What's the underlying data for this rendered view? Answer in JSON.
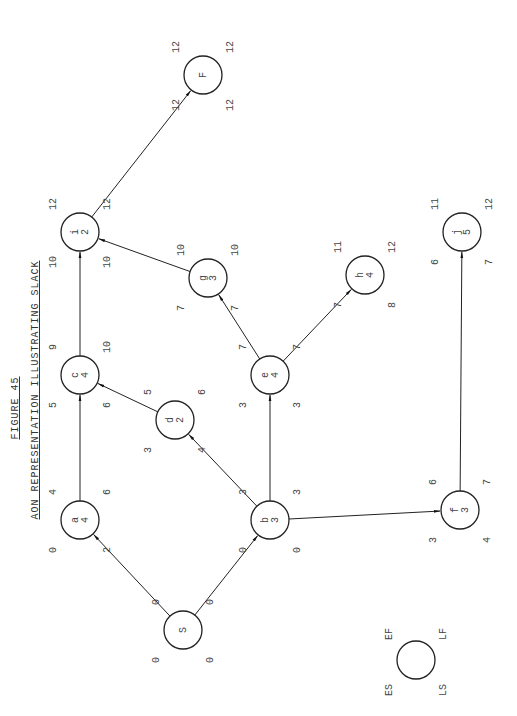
{
  "figure": {
    "number": "FIGURE 45",
    "title": "AON REPRESENTATION ILLUSTRATING SLACK",
    "orientation": "rotated 90 degrees counterclockwise"
  },
  "legend": {
    "es": "ES",
    "ef": "EF",
    "ls": "LS",
    "lf": "LF"
  },
  "nodes": [
    {
      "id": "S",
      "name": "S",
      "dur": "",
      "es": "0",
      "ef": "0",
      "ls": "0",
      "lf": "0",
      "x": 183,
      "y": 630
    },
    {
      "id": "a",
      "name": "a",
      "dur": "4",
      "es": "0",
      "ef": "4",
      "ls": "2",
      "lf": "6",
      "x": 80,
      "y": 520
    },
    {
      "id": "b",
      "name": "b",
      "dur": "3",
      "es": "0",
      "ef": "3",
      "ls": "0",
      "lf": "3",
      "x": 270,
      "y": 520
    },
    {
      "id": "c",
      "name": "c",
      "dur": "4",
      "es": "5",
      "ef": "9",
      "ls": "6",
      "lf": "10",
      "x": 80,
      "y": 375
    },
    {
      "id": "d",
      "name": "d",
      "dur": "2",
      "es": "3",
      "ef": "5",
      "ls": "4",
      "lf": "6",
      "x": 175,
      "y": 420
    },
    {
      "id": "e",
      "name": "e",
      "dur": "4",
      "es": "3",
      "ef": "7",
      "ls": "3",
      "lf": "7",
      "x": 270,
      "y": 375
    },
    {
      "id": "f",
      "name": "f",
      "dur": "3",
      "es": "3",
      "ef": "6",
      "ls": "4",
      "lf": "7",
      "x": 460,
      "y": 510
    },
    {
      "id": "g",
      "name": "g",
      "dur": "3",
      "es": "7",
      "ef": "10",
      "ls": "7",
      "lf": "10",
      "x": 208,
      "y": 278
    },
    {
      "id": "h",
      "name": "h",
      "dur": "4",
      "es": "7",
      "ef": "11",
      "ls": "8",
      "lf": "12",
      "x": 365,
      "y": 275
    },
    {
      "id": "i",
      "name": "i",
      "dur": "2",
      "es": "10",
      "ef": "12",
      "ls": "10",
      "lf": "12",
      "x": 80,
      "y": 232
    },
    {
      "id": "j",
      "name": "j",
      "dur": "5",
      "es": "6",
      "ef": "11",
      "ls": "7",
      "lf": "12",
      "x": 462,
      "y": 232
    },
    {
      "id": "F",
      "name": "F",
      "dur": "",
      "es": "12",
      "ef": "12",
      "ls": "12",
      "lf": "12",
      "x": 203,
      "y": 75
    }
  ],
  "edges": [
    [
      "S",
      "a"
    ],
    [
      "S",
      "b"
    ],
    [
      "a",
      "c"
    ],
    [
      "b",
      "d"
    ],
    [
      "b",
      "e"
    ],
    [
      "b",
      "f"
    ],
    [
      "d",
      "c"
    ],
    [
      "c",
      "i"
    ],
    [
      "e",
      "g"
    ],
    [
      "e",
      "h"
    ],
    [
      "g",
      "i"
    ],
    [
      "f",
      "j"
    ],
    [
      "i",
      "F"
    ]
  ]
}
